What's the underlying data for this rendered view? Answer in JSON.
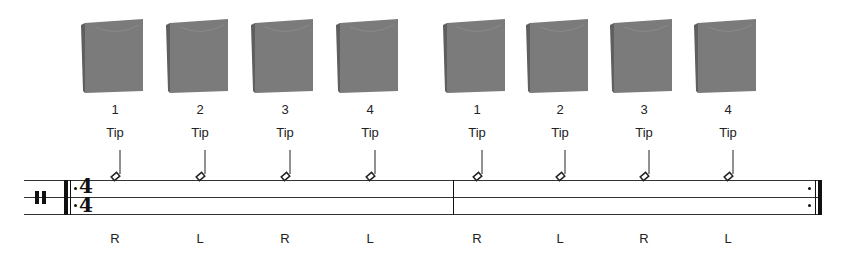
{
  "score": {
    "clef": "percussion",
    "time_signature": {
      "top": "4",
      "bottom": "4"
    },
    "repeat_start": true,
    "repeat_end": true,
    "measures": 2
  },
  "beats": [
    {
      "x": 115,
      "count": "1",
      "stroke": "Tip",
      "hand": "R"
    },
    {
      "x": 200,
      "count": "2",
      "stroke": "Tip",
      "hand": "L"
    },
    {
      "x": 285,
      "count": "3",
      "stroke": "Tip",
      "hand": "R"
    },
    {
      "x": 370,
      "count": "4",
      "stroke": "Tip",
      "hand": "L"
    },
    {
      "x": 477,
      "count": "1",
      "stroke": "Tip",
      "hand": "R"
    },
    {
      "x": 560,
      "count": "2",
      "stroke": "Tip",
      "hand": "L"
    },
    {
      "x": 644,
      "count": "3",
      "stroke": "Tip",
      "hand": "R"
    },
    {
      "x": 728,
      "count": "4",
      "stroke": "Tip",
      "hand": "L"
    }
  ],
  "colors": {
    "cajon": "#7a7a7a",
    "cajon_dark": "#5e5e5e",
    "ink": "#111111"
  }
}
